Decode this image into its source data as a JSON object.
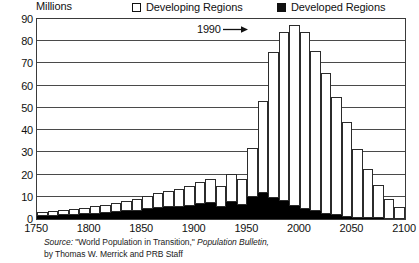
{
  "legend": {
    "yaxis_title": "Millions",
    "items": [
      {
        "label": "Developing Regions",
        "swatch": "hollow-square-icon",
        "color": "#ffffff"
      },
      {
        "label": "Developed Regions",
        "swatch": "filled-square-icon",
        "color": "#000000"
      }
    ]
  },
  "annotation": {
    "label": "1990",
    "arrow": "right-arrow-icon"
  },
  "source": {
    "line1_prefix": "Source:",
    "line1_mid": " \"World Population in Transition,\" ",
    "line1_italic": "Population Bulletin,",
    "line2": "by Thomas W. Merrick and PRB Staff"
  },
  "chart_data": {
    "type": "bar",
    "title": "",
    "subtitle": "",
    "xlabel": "",
    "ylabel": "Millions",
    "ylim": [
      0,
      90
    ],
    "xlim": [
      1750,
      2100
    ],
    "ytick_labels": [
      "0",
      "10",
      "20",
      "30",
      "40",
      "50",
      "60",
      "70",
      "80",
      "90"
    ],
    "ytick_values": [
      0,
      10,
      20,
      30,
      40,
      50,
      60,
      70,
      80,
      90
    ],
    "xtick_labels": [
      "1750",
      "1800",
      "1850",
      "1900",
      "1950",
      "2000",
      "2050",
      "2100"
    ],
    "xtick_values": [
      1750,
      1800,
      1850,
      1900,
      1950,
      2000,
      2050,
      2100
    ],
    "grid": true,
    "legend_position": "top",
    "stacked": true,
    "bar_interval_years": 10,
    "categories": [
      1750,
      1760,
      1770,
      1780,
      1790,
      1800,
      1810,
      1820,
      1830,
      1840,
      1850,
      1860,
      1870,
      1880,
      1890,
      1900,
      1910,
      1920,
      1930,
      1940,
      1950,
      1960,
      1970,
      1980,
      1990,
      2000,
      2010,
      2020,
      2030,
      2040,
      2050,
      2060,
      2070,
      2080,
      2090
    ],
    "series": [
      {
        "name": "Developed Regions",
        "color": "#000000",
        "values": [
          1.3,
          1.5,
          1.7,
          1.9,
          2.1,
          2.4,
          2.7,
          3.0,
          3.4,
          3.8,
          4.3,
          4.8,
          5.2,
          5.6,
          6.0,
          6.6,
          7.2,
          5.4,
          7.6,
          6.4,
          10.0,
          11.5,
          9.5,
          8.0,
          6.0,
          4.5,
          3.4,
          2.4,
          1.6,
          1.0,
          0.6,
          0.4,
          0.3,
          0.2,
          0.1
        ]
      },
      {
        "name": "Developing Regions",
        "color": "#ffffff",
        "values": [
          1.7,
          2.0,
          2.3,
          2.6,
          2.9,
          3.3,
          3.8,
          4.3,
          4.8,
          5.4,
          6.0,
          6.7,
          7.3,
          8.0,
          8.8,
          10.0,
          11.0,
          9.5,
          12.5,
          11.5,
          22.0,
          41.5,
          65.5,
          76.0,
          81.5,
          79.5,
          72.0,
          63.5,
          53.5,
          42.5,
          31.0,
          22.0,
          15.0,
          9.0,
          5.5
        ]
      }
    ],
    "totals": [
      3.0,
      3.5,
      4.0,
      4.5,
      5.0,
      5.7,
      6.5,
      7.3,
      8.2,
      9.2,
      10.3,
      11.5,
      12.5,
      13.6,
      14.8,
      16.6,
      18.2,
      14.9,
      20.1,
      17.9,
      32.0,
      53.0,
      75.0,
      84.0,
      87.5,
      84.0,
      75.4,
      65.9,
      55.1,
      43.5,
      31.6,
      22.4,
      15.3,
      9.2,
      5.6
    ],
    "peak": {
      "year": 1990,
      "value": 87.5,
      "annotated": true
    }
  }
}
